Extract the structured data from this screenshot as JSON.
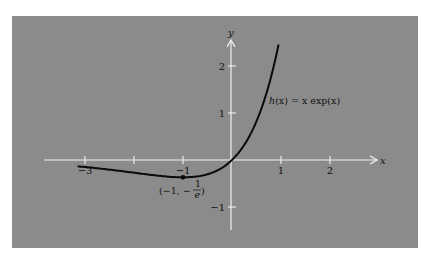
{
  "chart_data": {
    "type": "line",
    "title": "",
    "function": "h(x) = x exp(x)",
    "xlabel": "x",
    "ylabel": "y",
    "xlim": [
      -3.8,
      3.0
    ],
    "ylim": [
      -1.5,
      2.6
    ],
    "x_ticks": [
      -3,
      -2,
      -1,
      1,
      2
    ],
    "x_tick_labels": [
      "−3",
      "",
      "−1",
      "1",
      "2"
    ],
    "y_ticks": [
      -1,
      1,
      2
    ],
    "y_tick_labels": [
      "−1",
      "1",
      "2"
    ],
    "grid": false,
    "series": [
      {
        "name": "h(x) = x exp(x)",
        "x_range": [
          -3.15,
          0.95
        ],
        "x": [
          -3.0,
          -2.5,
          -2.0,
          -1.5,
          -1.0,
          -0.5,
          0.0,
          0.5,
          0.75,
          0.95
        ],
        "values": [
          -0.149,
          -0.205,
          -0.271,
          -0.335,
          -0.368,
          -0.303,
          0.0,
          0.824,
          1.588,
          2.456
        ]
      }
    ],
    "annotations": [
      {
        "text": "h(x) = x exp(x)",
        "x": 0.75,
        "y": 1.2
      },
      {
        "text": "(−1, −1/e)",
        "point": [
          -1,
          -0.368
        ]
      }
    ],
    "colors": {
      "background": "#8b8b8b",
      "axes": "#f0f0f0",
      "curve": "#0a0a0a"
    }
  },
  "labels": {
    "x_axis": "x",
    "y_axis": "y",
    "curve_label_h": "h",
    "curve_label_rest": "(x) = x exp(x)",
    "min_point_label_left": "(−1, −",
    "min_point_num": "1",
    "min_point_den": "e",
    "min_point_close": ")"
  }
}
